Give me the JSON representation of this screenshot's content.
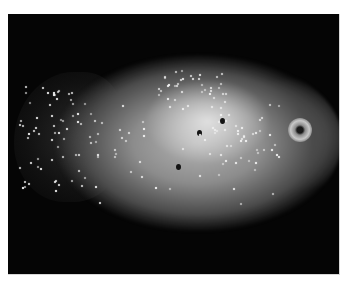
{
  "image": {
    "description": "Grayscale gross pathology photograph of an oval tissue specimen on a black background",
    "background_color": "#050505",
    "border_color": "#ffffff",
    "features": [
      {
        "name": "specimen-body",
        "tone": "light gray, glistening"
      },
      {
        "name": "left-lobe",
        "tone": "dark with bright specular highlights"
      },
      {
        "name": "ring-lesion",
        "tone": "pale ring with dark center",
        "position": "right"
      },
      {
        "name": "small-dark-foci",
        "count": 3
      }
    ]
  }
}
